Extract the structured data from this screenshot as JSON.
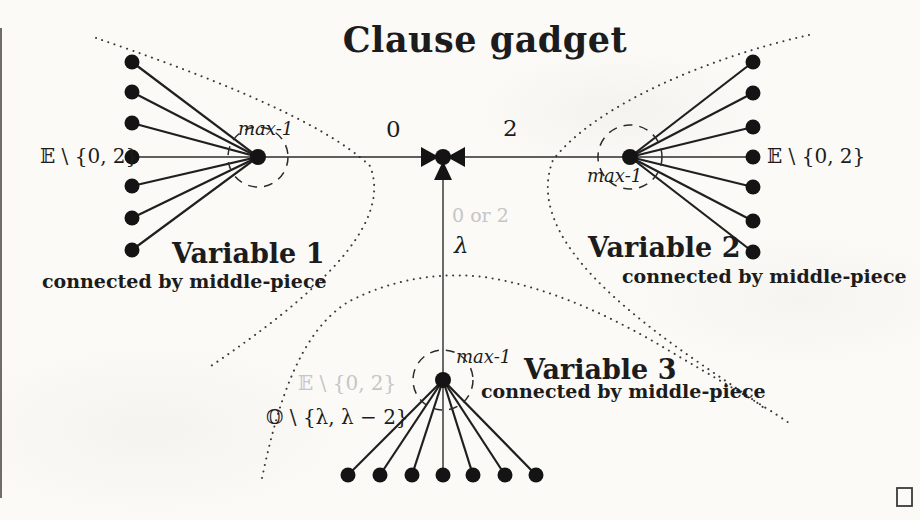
{
  "title": "Clause gadget",
  "colors": {
    "ink": "#1c1c1c",
    "faint_gray": "#c6c6c6",
    "paper": "#fbfaf7"
  },
  "center_junction": {
    "icon": "three-arrowheads-merge",
    "edge_label_left": "0",
    "edge_label_right": "2",
    "edge_label_down_faint": "0 or 2",
    "edge_label_down": "λ"
  },
  "variable1": {
    "title": "Variable 1",
    "subtitle": "connected by middle-piece",
    "hub_label": "max-1",
    "set_label": "𝔼 \\ {0, 2}",
    "leaf_count": 7
  },
  "variable2": {
    "title": "Variable 2",
    "subtitle": "connected by middle-piece",
    "hub_label": "max-1",
    "set_label": "𝔼 \\ {0, 2}",
    "leaf_count": 7
  },
  "variable3": {
    "title": "Variable 3",
    "subtitle": "connected by middle-piece",
    "hub_label": "max-1",
    "set_label_even_faint": "𝔼 \\ {0, 2}",
    "set_label_odd": "𝕆 \\ {λ, λ − 2}",
    "leaf_count": 7
  },
  "qed_icon": "open-square"
}
